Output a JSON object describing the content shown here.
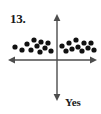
{
  "figure": {
    "number_label": "13.",
    "vertical_axis_label": "Yes",
    "ink_color": "#1a1a1a",
    "axis_color": "#4d4d4d",
    "dot_color": "#111111",
    "background_color": "#ffffff"
  },
  "chart_data": {
    "type": "scatter",
    "title": "13.",
    "xlabel": "",
    "ylabel": "Yes",
    "grid": false,
    "legend": false,
    "axis_style": "double-headed arrows through origin",
    "origin_px": {
      "x": 57,
      "y": 60
    },
    "xlim_px": [
      8,
      97
    ],
    "ylim_px": [
      14,
      100
    ],
    "point_count": 22,
    "point_radius_px": 2.6,
    "points_px": [
      {
        "x": 15,
        "y": 47
      },
      {
        "x": 22,
        "y": 50
      },
      {
        "x": 27,
        "y": 44
      },
      {
        "x": 31,
        "y": 50
      },
      {
        "x": 34,
        "y": 40
      },
      {
        "x": 37,
        "y": 46
      },
      {
        "x": 41,
        "y": 42
      },
      {
        "x": 40,
        "y": 52
      },
      {
        "x": 45,
        "y": 48
      },
      {
        "x": 48,
        "y": 43
      },
      {
        "x": 51,
        "y": 51
      },
      {
        "x": 62,
        "y": 46
      },
      {
        "x": 66,
        "y": 51
      },
      {
        "x": 69,
        "y": 43
      },
      {
        "x": 72,
        "y": 49
      },
      {
        "x": 76,
        "y": 40
      },
      {
        "x": 78,
        "y": 47
      },
      {
        "x": 82,
        "y": 51
      },
      {
        "x": 84,
        "y": 43
      },
      {
        "x": 88,
        "y": 48
      },
      {
        "x": 91,
        "y": 43
      },
      {
        "x": 94,
        "y": 50
      }
    ],
    "annotations": [
      {
        "text": "13.",
        "x": 10,
        "y": 12,
        "role": "exercise-number"
      },
      {
        "text": "Yes",
        "x": 65,
        "y": 96,
        "role": "axis-annotation"
      }
    ]
  }
}
